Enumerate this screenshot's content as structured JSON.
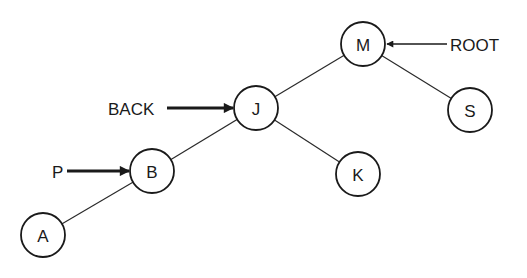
{
  "diagram": {
    "type": "binary-search-tree",
    "nodes": [
      {
        "id": "M",
        "label": "M",
        "cx": 363,
        "cy": 44,
        "r": 22
      },
      {
        "id": "J",
        "label": "J",
        "cx": 256,
        "cy": 108,
        "r": 22
      },
      {
        "id": "S",
        "label": "S",
        "cx": 470,
        "cy": 110,
        "r": 22
      },
      {
        "id": "B",
        "label": "B",
        "cx": 152,
        "cy": 171,
        "r": 22
      },
      {
        "id": "K",
        "label": "K",
        "cx": 358,
        "cy": 174,
        "r": 22
      },
      {
        "id": "A",
        "label": "A",
        "cx": 43,
        "cy": 235,
        "r": 22
      }
    ],
    "edges": [
      {
        "from": "M",
        "to": "J"
      },
      {
        "from": "M",
        "to": "S"
      },
      {
        "from": "J",
        "to": "B"
      },
      {
        "from": "J",
        "to": "K"
      },
      {
        "from": "B",
        "to": "A"
      }
    ],
    "pointers": [
      {
        "label": "ROOT",
        "target": "M",
        "side": "right",
        "style": "thin",
        "label_x": 450,
        "label_y": 44,
        "line_x1": 447,
        "line_y": 44,
        "line_x2": 386
      },
      {
        "label": "BACK",
        "target": "J",
        "side": "left",
        "style": "thick",
        "label_x": 108,
        "label_y": 108,
        "line_x1": 167,
        "line_y": 108,
        "line_x2": 234
      },
      {
        "label": "P",
        "target": "B",
        "side": "left",
        "style": "thick",
        "label_x": 53,
        "label_y": 171,
        "line_x1": 67,
        "line_y": 171,
        "line_x2": 130
      }
    ]
  },
  "labels": {
    "node_M": "M",
    "node_J": "J",
    "node_S": "S",
    "node_B": "B",
    "node_K": "K",
    "node_A": "A",
    "pointer_root": "ROOT",
    "pointer_back": "BACK",
    "pointer_p": "P"
  }
}
